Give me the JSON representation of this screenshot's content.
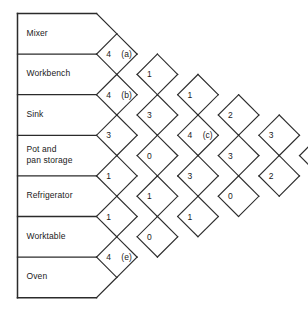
{
  "chart_data": {
    "type": "diagram",
    "departments": [
      "Mixer",
      "Workbench",
      "Sink",
      "Pot and\npan storage",
      "Refrigerator",
      "Worktable",
      "Oven"
    ],
    "rating_scale": "0–4 closeness rating shown in left half of each diamond; lettered cells (a)–(e) are unknowns",
    "diagonals": [
      {
        "index": 0,
        "pairs_offset": 1,
        "cells": [
          {
            "row": 0,
            "value": "4",
            "tag": "(a)"
          },
          {
            "row": 1,
            "value": "4",
            "tag": "(b)"
          },
          {
            "row": 2,
            "value": "3",
            "tag": ""
          },
          {
            "row": 3,
            "value": "1",
            "tag": ""
          },
          {
            "row": 4,
            "value": "1",
            "tag": ""
          },
          {
            "row": 5,
            "value": "4",
            "tag": "(e)"
          }
        ]
      },
      {
        "index": 1,
        "pairs_offset": 2,
        "cells": [
          {
            "row": 0,
            "value": "1",
            "tag": ""
          },
          {
            "row": 1,
            "value": "3",
            "tag": ""
          },
          {
            "row": 2,
            "value": "0",
            "tag": ""
          },
          {
            "row": 3,
            "value": "1",
            "tag": ""
          },
          {
            "row": 4,
            "value": "0",
            "tag": ""
          }
        ]
      },
      {
        "index": 2,
        "pairs_offset": 3,
        "cells": [
          {
            "row": 0,
            "value": "1",
            "tag": ""
          },
          {
            "row": 1,
            "value": "4",
            "tag": "(c)"
          },
          {
            "row": 2,
            "value": "3",
            "tag": ""
          },
          {
            "row": 3,
            "value": "1",
            "tag": ""
          }
        ]
      },
      {
        "index": 3,
        "pairs_offset": 4,
        "cells": [
          {
            "row": 0,
            "value": "2",
            "tag": ""
          },
          {
            "row": 1,
            "value": "3",
            "tag": ""
          },
          {
            "row": 2,
            "value": "0",
            "tag": ""
          }
        ]
      },
      {
        "index": 4,
        "pairs_offset": 5,
        "cells": [
          {
            "row": 0,
            "value": "3",
            "tag": ""
          },
          {
            "row": 1,
            "value": "2",
            "tag": ""
          }
        ]
      },
      {
        "index": 5,
        "pairs_offset": 6,
        "cells": [
          {
            "row": 0,
            "value": "0",
            "tag": "(d)"
          }
        ]
      }
    ],
    "cell_labels": [
      "(a)",
      "(b)",
      "(c)",
      "(d)",
      "(e)"
    ],
    "colors": {
      "line": "#2b2b2b",
      "text": "#1a1a1a",
      "background": "#ffffff"
    }
  }
}
